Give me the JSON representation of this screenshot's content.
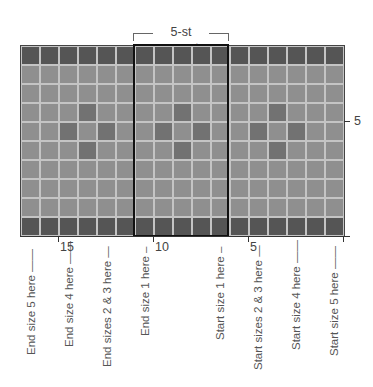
{
  "header": {
    "repeat_label": "5-st repeat"
  },
  "chart": {
    "columns": 17,
    "rows": 10,
    "cell_size_px": 19,
    "repeat": {
      "start_col": 6,
      "width_cols": 5
    },
    "colors": {
      "border_row": "#555555",
      "background": "#8f8f8f",
      "motif": "#727272",
      "grid_line": "#c4c4c4",
      "repeat_outline": "#111111"
    },
    "dark_rows": [
      0,
      9
    ],
    "motif_cells": [
      [
        3,
        3
      ],
      [
        3,
        8
      ],
      [
        3,
        13
      ],
      [
        4,
        2
      ],
      [
        4,
        4
      ],
      [
        4,
        7
      ],
      [
        4,
        9
      ],
      [
        4,
        12
      ],
      [
        4,
        14
      ],
      [
        5,
        3
      ],
      [
        5,
        8
      ],
      [
        5,
        13
      ]
    ]
  },
  "axis": {
    "stitch_ticks": [
      {
        "label": "15",
        "x": 58
      },
      {
        "label": "10",
        "x": 153
      },
      {
        "label": "5",
        "x": 248
      },
      {
        "label": "",
        "x": 343
      }
    ],
    "row_marker": {
      "label": "5"
    }
  },
  "size_labels": [
    {
      "text": "End size 5 here ——",
      "x": 25,
      "bottom": 355
    },
    {
      "text": "End size 4 here ——",
      "x": 63,
      "bottom": 347
    },
    {
      "text": "End sizes 2 & 3 here —",
      "x": 101,
      "bottom": 367
    },
    {
      "text": "End size 1 here –",
      "x": 139,
      "bottom": 336
    },
    {
      "text": "Start size 1 here –",
      "x": 214,
      "bottom": 340
    },
    {
      "text": "Start sizes 2 & 3 here —",
      "x": 252,
      "bottom": 370
    },
    {
      "text": "Start size 4 here ——",
      "x": 290,
      "bottom": 350
    },
    {
      "text": "Start size 5 here ——",
      "x": 328,
      "bottom": 356
    }
  ]
}
